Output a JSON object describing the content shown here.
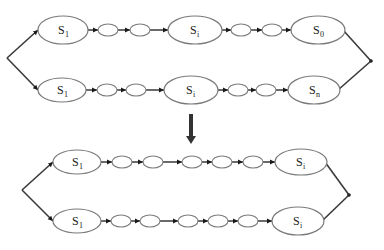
{
  "diagram": {
    "colors": {
      "stroke": "#7a7a7a",
      "edge": "#2a2a2a",
      "background": "#ffffff"
    },
    "groups": [
      {
        "name": "before",
        "left_junction": [
          7,
          58
        ],
        "right_junction": [
          371,
          61
        ],
        "chains": [
          {
            "name": "top-chain-1",
            "y": 30,
            "nodes": [
              {
                "type": "state",
                "label": "S",
                "sub": "1",
                "cx": 63,
                "rx": 25,
                "ry": 14
              },
              {
                "type": "small",
                "cx": 108,
                "rx": 10,
                "ry": 6
              },
              {
                "type": "small",
                "cx": 140,
                "rx": 10,
                "ry": 6
              },
              {
                "type": "state",
                "label": "S",
                "sub": "i",
                "cx": 195,
                "rx": 27,
                "ry": 14
              },
              {
                "type": "small",
                "cx": 241,
                "rx": 10,
                "ry": 6
              },
              {
                "type": "small",
                "cx": 272,
                "rx": 10,
                "ry": 6
              },
              {
                "type": "state",
                "label": "S",
                "sub": "0",
                "cx": 318,
                "rx": 27,
                "ry": 14
              }
            ]
          },
          {
            "name": "top-chain-2",
            "y": 90,
            "nodes": [
              {
                "type": "state",
                "label": "S",
                "sub": "1",
                "cx": 62,
                "rx": 24,
                "ry": 12
              },
              {
                "type": "small",
                "cx": 107,
                "rx": 10,
                "ry": 6
              },
              {
                "type": "small",
                "cx": 136,
                "rx": 10,
                "ry": 6
              },
              {
                "type": "state",
                "label": "S",
                "sub": "i",
                "cx": 191,
                "rx": 27,
                "ry": 14
              },
              {
                "type": "small",
                "cx": 238,
                "rx": 10,
                "ry": 6
              },
              {
                "type": "small",
                "cx": 266,
                "rx": 10,
                "ry": 6
              },
              {
                "type": "state",
                "label": "S",
                "sub": "n",
                "cx": 314,
                "rx": 26,
                "ry": 14
              }
            ]
          }
        ]
      },
      {
        "name": "after",
        "left_junction": [
          22,
          190
        ],
        "right_junction": [
          349,
          195
        ],
        "chains": [
          {
            "name": "bottom-chain-1",
            "y": 162,
            "nodes": [
              {
                "type": "state",
                "label": "S",
                "sub": "1",
                "cx": 77,
                "rx": 24,
                "ry": 12
              },
              {
                "type": "small",
                "cx": 122,
                "rx": 10,
                "ry": 6
              },
              {
                "type": "small",
                "cx": 153,
                "rx": 10,
                "ry": 6
              },
              {
                "type": "small",
                "cx": 192,
                "rx": 10,
                "ry": 6
              },
              {
                "type": "small",
                "cx": 222,
                "rx": 10,
                "ry": 6
              },
              {
                "type": "small",
                "cx": 253,
                "rx": 10,
                "ry": 6
              },
              {
                "type": "state",
                "label": "S",
                "sub": "i",
                "cx": 301,
                "rx": 26,
                "ry": 13
              }
            ]
          },
          {
            "name": "bottom-chain-2",
            "y": 221,
            "nodes": [
              {
                "type": "state",
                "label": "S",
                "sub": "1",
                "cx": 77,
                "rx": 24,
                "ry": 12
              },
              {
                "type": "small",
                "cx": 121,
                "rx": 10,
                "ry": 6
              },
              {
                "type": "small",
                "cx": 150,
                "rx": 10,
                "ry": 6
              },
              {
                "type": "small",
                "cx": 188,
                "rx": 10,
                "ry": 6
              },
              {
                "type": "small",
                "cx": 218,
                "rx": 10,
                "ry": 6
              },
              {
                "type": "small",
                "cx": 248,
                "rx": 10,
                "ry": 6
              },
              {
                "type": "state",
                "label": "S",
                "sub": "i",
                "cx": 298,
                "rx": 26,
                "ry": 14
              }
            ]
          }
        ]
      }
    ],
    "transform_arrow": {
      "x": 191,
      "y1": 114,
      "y2": 144,
      "direction": "down"
    }
  }
}
